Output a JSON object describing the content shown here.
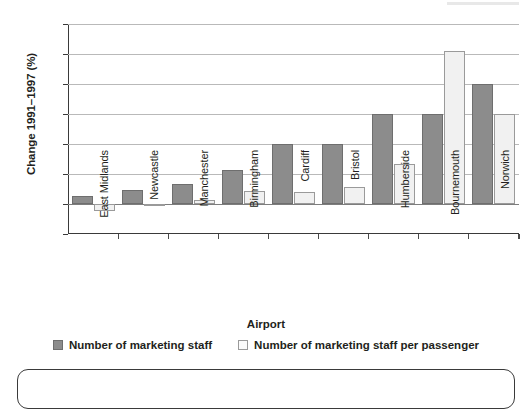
{
  "chart_data": {
    "type": "bar",
    "title": "",
    "xlabel": "Airport",
    "ylabel": "Change 1991–1997 (%)",
    "categories": [
      "East Midlands",
      "Newcastle",
      "Manchester",
      "Birmingham",
      "Cardiff",
      "Bristol",
      "Humberside",
      "Bournemouth",
      "Norwich"
    ],
    "series": [
      {
        "name": "Number of marketing staff",
        "color": "#8c8c8c",
        "values": [
          28,
          48,
          68,
          115,
          200,
          200,
          300,
          300,
          400
        ]
      },
      {
        "name": "Number of marketing staff per passenger",
        "color": "#f1f1f1",
        "values": [
          -22,
          -5,
          12,
          42,
          40,
          58,
          135,
          510,
          300
        ]
      }
    ],
    "ylim": [
      -100,
      600
    ],
    "yticks": [
      -100,
      0,
      100,
      200,
      300,
      400,
      500,
      600
    ],
    "ytick_labels": [
      "−100",
      "0",
      "100",
      "200",
      "300",
      "400",
      "500",
      "600"
    ],
    "grid": true,
    "legend_position": "bottom"
  },
  "axis": {
    "y_title": "Change 1991–1997 (%)",
    "x_title": "Airport"
  },
  "legend": {
    "items": [
      {
        "label": "Number of marketing staff",
        "swatch": "dark"
      },
      {
        "label": "Number of marketing staff per passenger",
        "swatch": "light"
      }
    ]
  },
  "colors": {
    "series_dark": "#8c8c8c",
    "series_light": "#f1f1f1",
    "gridline": "#b9b9b9",
    "axis": "#3a3a3a",
    "text": "#231f20"
  }
}
